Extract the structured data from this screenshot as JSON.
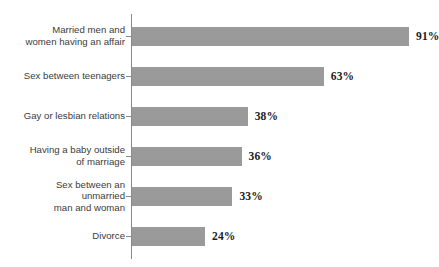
{
  "chart_data": {
    "type": "bar",
    "orientation": "horizontal",
    "title": "",
    "subtitle": "",
    "xlabel": "",
    "ylabel": "",
    "xlim": [
      0,
      100
    ],
    "grid": false,
    "legend": null,
    "value_suffix": "%",
    "bar_color": "#9a9a9a",
    "axis_color": "#8a8a8a",
    "label_color": "#3b3b3b",
    "value_color": "#1c1c1c",
    "categories": [
      "Married men and\nwomen having an affair",
      "Sex between teenagers",
      "Gay or lesbian relations",
      "Having a baby outside\nof marriage",
      "Sex between an\nunmarried\nman and woman",
      "Divorce"
    ],
    "values": [
      91,
      63,
      38,
      36,
      33,
      24
    ],
    "data_labels": [
      "91%",
      "63%",
      "38%",
      "36%",
      "33%",
      "24%"
    ]
  }
}
